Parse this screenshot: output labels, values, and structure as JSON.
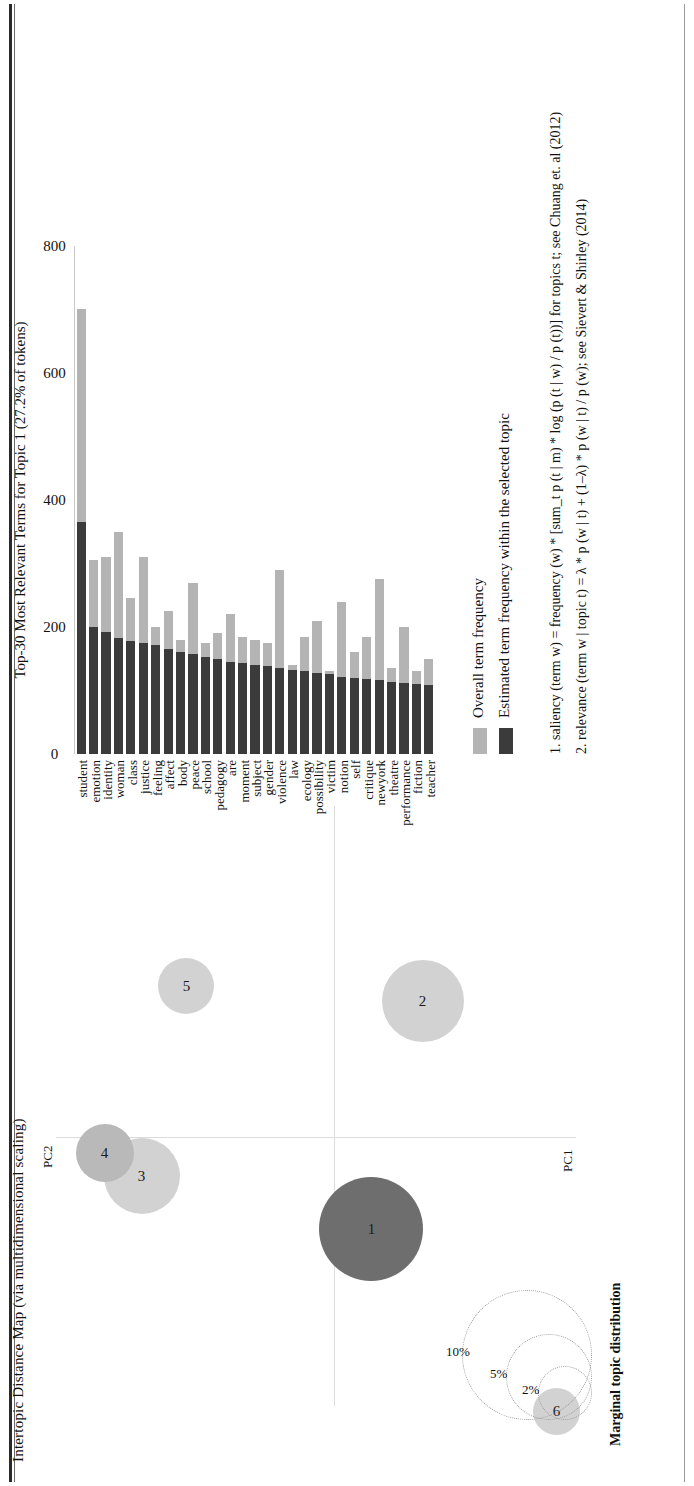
{
  "figure": {
    "left_panel_title": "Intertopic Distance Map (via multidimensional scaling)",
    "axis_x_label": "PC1",
    "axis_y_label": "PC2",
    "marginal_legend_title": "Marginal topic distribution",
    "marginal_legend_sizes": [
      "2%",
      "5%",
      "10%"
    ]
  },
  "bar_panel": {
    "title": "Top-30 Most Relevant Terms for Topic 1 (27.2% of tokens)"
  },
  "legend": {
    "items": [
      {
        "label": "Overall term frequency",
        "color": "#b4b4b4"
      },
      {
        "label": "Estimated term frequency within the selected topic",
        "color": "#3b3b3b"
      }
    ],
    "notes": [
      "1. saliency (term w) = frequency (w) * [sum_t p (t | m) * log (p (t | w) / p (t))] for topics t; see Chuang et. al (2012)",
      "2. relevance (term w | topic t) = λ * p (w | t) + (1–λ) * p (w | t) / p (w); see Sievert & Shirley (2014)"
    ]
  },
  "chart_data": [
    {
      "type": "scatter",
      "title": "Intertopic Distance Map (via multidimensional scaling)",
      "xlabel": "PC1",
      "ylabel": "PC2",
      "grid": false,
      "legend_position": "bottom-left",
      "points": [
        {
          "label": "1",
          "x": -0.12,
          "y": -0.05,
          "size_pct": 27.2,
          "selected": true,
          "radius_px": 104,
          "color": "#6e6e6e"
        },
        {
          "label": "2",
          "x": 0.18,
          "y": -0.12,
          "size_pct": 19.0,
          "selected": false,
          "radius_px": 82,
          "color": "#d2d2d2"
        },
        {
          "label": "3",
          "x": -0.05,
          "y": 0.26,
          "size_pct": 16.0,
          "selected": false,
          "radius_px": 76,
          "color": "#d2d2d2"
        },
        {
          "label": "4",
          "x": -0.02,
          "y": 0.31,
          "size_pct": 12.0,
          "selected": false,
          "radius_px": 58,
          "color": "#b9b9b9"
        },
        {
          "label": "5",
          "x": 0.2,
          "y": 0.2,
          "size_pct": 11.0,
          "selected": false,
          "radius_px": 56,
          "color": "#d2d2d2"
        },
        {
          "label": "6",
          "x": -0.36,
          "y": -0.3,
          "size_pct": 9.0,
          "selected": false,
          "radius_px": 47,
          "color": "#d2d2d2"
        }
      ]
    },
    {
      "type": "bar",
      "orientation": "horizontal",
      "title": "Top-30 Most Relevant Terms for Topic 1 (27.2% of tokens)",
      "xlabel": "",
      "ylabel": "",
      "xlim": [
        0,
        800
      ],
      "xticks": [
        0,
        200,
        400,
        600,
        800
      ],
      "grid": false,
      "categories": [
        "student",
        "emotion",
        "identity",
        "woman",
        "class",
        "justice",
        "feeling",
        "affect",
        "body",
        "peace",
        "school",
        "pedagogy",
        "are",
        "moment",
        "subject",
        "gender",
        "violence",
        "law",
        "ecology",
        "possibility",
        "victim",
        "notion",
        "self",
        "critique",
        "newyork",
        "theatre",
        "performance",
        "fiction",
        "teacher"
      ],
      "series": [
        {
          "name": "Overall term frequency",
          "color": "#b4b4b4",
          "values": [
            700,
            305,
            310,
            350,
            245,
            310,
            200,
            225,
            180,
            270,
            175,
            190,
            220,
            185,
            180,
            175,
            290,
            140,
            185,
            210,
            130,
            240,
            160,
            185,
            275,
            135,
            200,
            130,
            150
          ]
        },
        {
          "name": "Estimated term frequency within the selected topic",
          "color": "#3b3b3b",
          "values": [
            365,
            200,
            192,
            182,
            178,
            175,
            172,
            165,
            160,
            158,
            152,
            150,
            145,
            143,
            140,
            138,
            136,
            132,
            130,
            128,
            126,
            122,
            120,
            118,
            116,
            114,
            112,
            110,
            108
          ]
        }
      ]
    }
  ]
}
